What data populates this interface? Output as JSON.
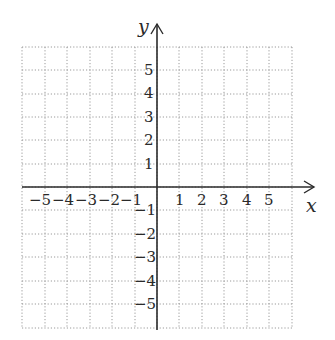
{
  "diagram": {
    "type": "coordinate-plane",
    "x_axis": {
      "name": "x",
      "ticks": [
        "-5",
        "-4",
        "-3",
        "-2",
        "-1",
        "1",
        "2",
        "3",
        "4",
        "5"
      ]
    },
    "y_axis": {
      "name": "y",
      "ticks": [
        "5",
        "4",
        "3",
        "2",
        "1",
        "-1",
        "-2",
        "-3",
        "-4",
        "-5"
      ]
    },
    "grid": {
      "x_range": [
        -6,
        6
      ],
      "y_range": [
        -6,
        6
      ],
      "style": "dotted"
    },
    "colors": {
      "axis": "#2b2b2b",
      "grid": "#9a9a9a",
      "text": "#2a2a2a"
    }
  },
  "labels": {
    "x_name": "x",
    "y_name": "y",
    "x_neg": [
      "−5",
      "−4",
      "−3",
      "−2",
      "−1"
    ],
    "x_pos": [
      "1",
      "2",
      "3",
      "4",
      "5"
    ],
    "y_pos": [
      "5",
      "4",
      "3",
      "2",
      "1"
    ],
    "y_neg": [
      "−1",
      "−2",
      "−3",
      "−4",
      "−5"
    ]
  }
}
